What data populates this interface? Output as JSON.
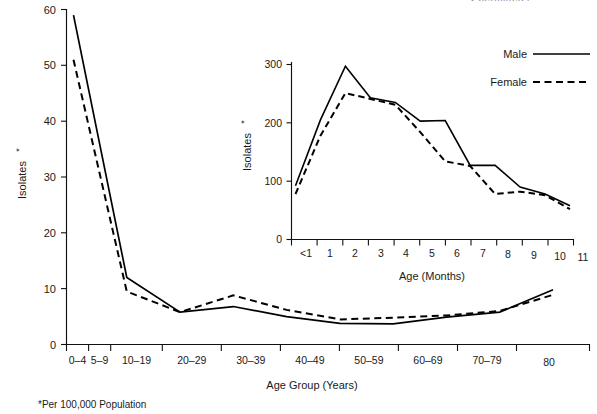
{
  "figure": {
    "footnote": "*Per 100,000 Population",
    "clipped_header": "y permitted l"
  },
  "main_chart": {
    "ylabel": "Isolates",
    "ylabel_superscript": "*",
    "xlabel": "Age Group (Years)",
    "y_ticks": [
      "0",
      "10",
      "20",
      "30",
      "40",
      "50",
      "60"
    ],
    "x_categories": [
      "0–4",
      "5–9",
      "10–19",
      "20–29",
      "30–39",
      "40–49",
      "50–59",
      "60–69",
      "70–79",
      "80"
    ]
  },
  "inset_chart": {
    "ylabel": "Isolates",
    "ylabel_superscript": "*",
    "xlabel": "Age (Months)",
    "y_ticks": [
      "0",
      "100",
      "200",
      "300"
    ],
    "x_categories": [
      "<1",
      "1",
      "2",
      "3",
      "4",
      "5",
      "6",
      "7",
      "8",
      "9",
      "10",
      "11"
    ]
  },
  "legend": {
    "items": [
      {
        "label": "Male",
        "style": "solid"
      },
      {
        "label": "Female",
        "style": "dashed"
      }
    ]
  },
  "chart_data": [
    {
      "type": "line",
      "id": "main",
      "title": "",
      "xlabel": "Age Group (Years)",
      "ylabel": "Isolates*",
      "ylim": [
        0,
        60
      ],
      "grid": false,
      "legend_position": "inset-top-right",
      "categories": [
        "0–4",
        "5–9",
        "10–19",
        "20–29",
        "30–39",
        "40–49",
        "50–59",
        "60–69",
        "70–79",
        "80"
      ],
      "series": [
        {
          "name": "Male",
          "style": "solid",
          "values": [
            59.0,
            12.0,
            5.8,
            6.8,
            5.0,
            3.8,
            3.7,
            4.9,
            5.8,
            9.8
          ]
        },
        {
          "name": "Female",
          "style": "dashed",
          "values": [
            51.0,
            9.5,
            5.8,
            8.8,
            6.2,
            4.5,
            4.8,
            5.2,
            6.0,
            8.9
          ]
        }
      ]
    },
    {
      "type": "line",
      "id": "inset",
      "title": "",
      "xlabel": "Age (Months)",
      "ylabel": "Isolates*",
      "ylim": [
        0,
        300
      ],
      "grid": false,
      "legend_position": "top-right",
      "categories": [
        "<1",
        "1",
        "2",
        "3",
        "4",
        "5",
        "6",
        "7",
        "8",
        "9",
        "10",
        "11"
      ],
      "series": [
        {
          "name": "Male",
          "style": "solid",
          "values": [
            92,
            205,
            297,
            243,
            235,
            203,
            204,
            127,
            127,
            90,
            78,
            58
          ]
        },
        {
          "name": "Female",
          "style": "dashed",
          "values": [
            78,
            178,
            251,
            241,
            231,
            184,
            134,
            126,
            78,
            82,
            76,
            52
          ]
        }
      ]
    }
  ]
}
